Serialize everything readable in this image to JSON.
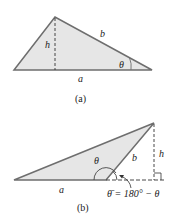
{
  "figure_a": {
    "caption": "(a)",
    "labels": {
      "h": "h",
      "b": "b",
      "a": "a",
      "theta": "θ"
    }
  },
  "figure_b": {
    "caption": "(b)",
    "labels": {
      "h": "h",
      "b": "b",
      "a": "a",
      "theta": "θ",
      "theta_bar_eq": "θ̄ = 180° − θ"
    }
  },
  "colors": {
    "fill": "#e6e6e6",
    "stroke": "#6e6e6e",
    "text": "#222222"
  }
}
